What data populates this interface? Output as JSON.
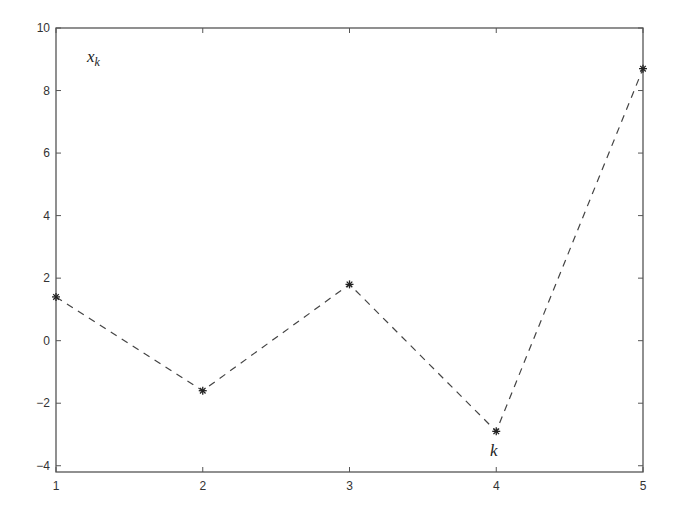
{
  "chart_data": {
    "type": "line",
    "title": "",
    "xlabel": "",
    "ylabel": "",
    "x": [
      1,
      2,
      3,
      4,
      5
    ],
    "series": [
      {
        "name": "x_k",
        "values": [
          1.4,
          -1.6,
          1.8,
          -2.9,
          8.7
        ],
        "line_style": "dashed",
        "marker": "*",
        "color": "#333333"
      }
    ],
    "xlim": [
      1,
      5
    ],
    "ylim": [
      -4.2,
      10
    ],
    "xticks": [
      1,
      2,
      3,
      4,
      5
    ],
    "yticks": [
      -4,
      -2,
      0,
      2,
      4,
      6,
      8,
      10
    ],
    "grid": false,
    "legend": null,
    "annotations": [
      {
        "text": "x",
        "subscript": "k",
        "position": "upper-left inside axes"
      },
      {
        "text": "k",
        "near_point": 4
      }
    ]
  },
  "labels": {
    "xk_main": "x",
    "xk_sub": "k",
    "k_label": "k"
  }
}
